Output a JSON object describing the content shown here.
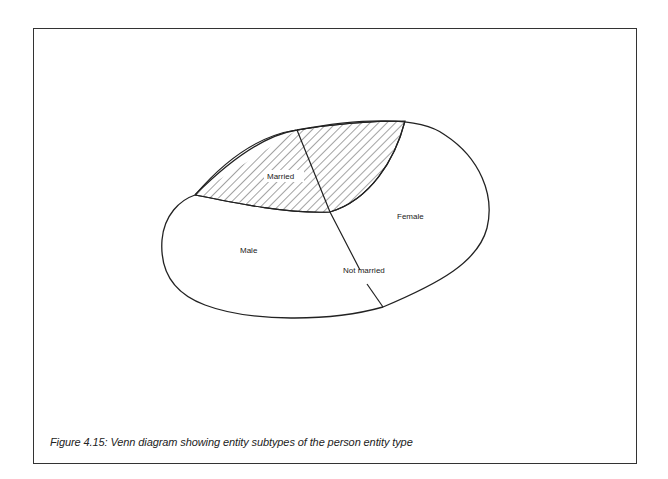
{
  "figure": {
    "caption": "Figure 4.15: Venn diagram showing entity subtypes of the person entity type"
  },
  "diagram": {
    "type": "venn",
    "labels": {
      "married": "Married",
      "female": "Female",
      "male": "Male",
      "not_married": "Not married"
    },
    "regions": [
      {
        "name": "Married",
        "style": "hatched"
      },
      {
        "name": "Not married",
        "style": "plain"
      },
      {
        "name": "Male",
        "style": "plain"
      },
      {
        "name": "Female",
        "style": "plain"
      }
    ],
    "colors": {
      "stroke": "#222222",
      "hatch": "#333333",
      "background": "#ffffff"
    }
  }
}
